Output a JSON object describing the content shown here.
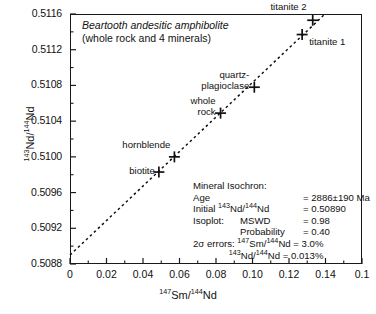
{
  "chart_data": {
    "type": "scatter",
    "title": "Beartooth andesitic amphibolite",
    "subtitle": "(whole rock and 4 minerals)",
    "xlabel_html": "<sup>147</sup>Sm/<sup>144</sup>Nd",
    "ylabel_html": "<sup>143</sup>Nd/<sup>144</sup>Nd",
    "xlim": [
      0,
      0.16
    ],
    "ylim": [
      0.5088,
      0.5116
    ],
    "xticks": [
      "0",
      "0.02",
      "0.04",
      "0.06",
      "0.08",
      "0.10",
      "0.12",
      "0.14",
      "0.1"
    ],
    "xtick_values": [
      0,
      0.02,
      0.04,
      0.06,
      0.08,
      0.1,
      0.12,
      0.14,
      0.16
    ],
    "yticks": [
      "0.5116",
      "0.5112",
      "0.5108",
      "0.5104",
      "0.5100",
      "0.5096",
      "0.5092",
      "0.5088"
    ],
    "ytick_values": [
      0.5116,
      0.5112,
      0.5108,
      0.5104,
      0.51,
      0.5096,
      0.5092,
      0.5088
    ],
    "grid": false,
    "minor_ticks": true,
    "legend": "none",
    "points": [
      {
        "name": "biotite",
        "x": 0.0487,
        "y": 0.50983,
        "label": "biotite",
        "label_pos": "left"
      },
      {
        "name": "hornblende",
        "x": 0.0572,
        "y": 0.51,
        "label": "hornblende",
        "label_pos": "above-left"
      },
      {
        "name": "whole rock",
        "x": 0.0825,
        "y": 0.51049,
        "label": "whole\nrock",
        "label_pos": "left"
      },
      {
        "name": "quartz-plagioclase",
        "x": 0.101,
        "y": 0.51078,
        "label": "quartz-\nplagioclase",
        "label_pos": "left"
      },
      {
        "name": "titanite 1",
        "x": 0.1272,
        "y": 0.51137,
        "label": "titanite 1",
        "label_pos": "right"
      },
      {
        "name": "titanite 2",
        "x": 0.133,
        "y": 0.51153,
        "label": "titanite 2",
        "label_pos": "above-left"
      }
    ],
    "regression": {
      "style": "dashed",
      "intercept": 0.5089,
      "slope": 0.019323,
      "label": "mineral isochron"
    },
    "annotations": {
      "heading": "Mineral Isochron:",
      "rows": [
        {
          "key": "Age",
          "key2": "",
          "value": "= 2886±190 Ma"
        },
        {
          "key": "Initial ",
          "key_html": "Initial <sup>143</sup>Nd/<sup>144</sup>Nd",
          "value": "= 0.50890"
        },
        {
          "key": "Isoplot:",
          "key2": "MSWD",
          "value": "= 0.98"
        },
        {
          "key": "",
          "key2": "Probability",
          "value": "= 0.40"
        }
      ],
      "errors_line1_html": "2σ errors: <sup>147</sup>Sm/<sup>144</sup>Nd = 3.0%",
      "errors_line2_html": "<sup>143</sup>Nd/<sup>144</sup>Nd = 0.013%"
    }
  }
}
